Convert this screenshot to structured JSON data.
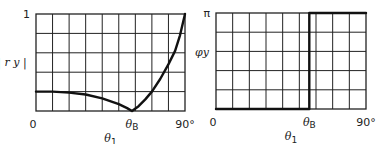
{
  "chart_data": [
    {
      "type": "line",
      "title": "",
      "xlabel": "θ1",
      "ylabel": "| r y |",
      "xlim": [
        0,
        90
      ],
      "ylim": [
        0,
        1
      ],
      "grid": true,
      "grid_divisions": {
        "x": 9,
        "y": 5
      },
      "x_tick_labels": [
        {
          "value": 0,
          "label": "0"
        },
        {
          "value": 58,
          "label": "θB"
        },
        {
          "value": 90,
          "label": "90°"
        }
      ],
      "y_tick_labels": [
        {
          "value": 1,
          "label": "1"
        }
      ],
      "series": [
        {
          "name": "|r_y|",
          "x": [
            0,
            10,
            20,
            30,
            40,
            50,
            55,
            58,
            62,
            66,
            70,
            75,
            80,
            84,
            87,
            90
          ],
          "y": [
            0.2,
            0.2,
            0.19,
            0.17,
            0.13,
            0.07,
            0.03,
            0.0,
            0.05,
            0.12,
            0.2,
            0.33,
            0.48,
            0.62,
            0.78,
            1.0
          ]
        }
      ]
    },
    {
      "type": "line",
      "title": "",
      "xlabel": "θ1",
      "ylabel": "φy",
      "xlim": [
        0,
        90
      ],
      "ylim": [
        0,
        3.1416
      ],
      "grid": true,
      "grid_divisions": {
        "x": 9,
        "y": 5
      },
      "x_tick_labels": [
        {
          "value": 0,
          "label": "0"
        },
        {
          "value": 56,
          "label": "θB"
        },
        {
          "value": 90,
          "label": "90°"
        }
      ],
      "y_tick_labels": [
        {
          "value": 3.1416,
          "label": "π"
        }
      ],
      "series": [
        {
          "name": "φ_y",
          "x": [
            0,
            56,
            56,
            90
          ],
          "y": [
            0,
            0,
            3.1416,
            3.1416
          ]
        }
      ]
    }
  ]
}
